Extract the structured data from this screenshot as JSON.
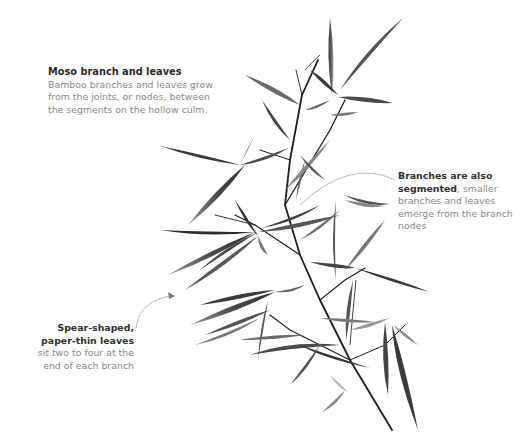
{
  "figure": {
    "colors": {
      "background": "#ffffff",
      "leaf": "#555555",
      "stem": "#1e1e1e",
      "callout_line": "#9a9a9a",
      "heading_text": "#2b2b2b",
      "body_text": "#8a8a8a"
    }
  },
  "captions": {
    "main": {
      "title": "Moso branch and leaves",
      "body": "Bamboo branches and leaves grow from the joints, or nodes, between the segments on the hollow culm."
    },
    "segments": {
      "bold": "Branches are also segmented",
      "body": ", smaller branches and leaves emerge from the branch nodes"
    },
    "leaves": {
      "bold": "Spear-shaped, paper-thin leaves",
      "body": " sit two to four at the end of each branch"
    }
  }
}
